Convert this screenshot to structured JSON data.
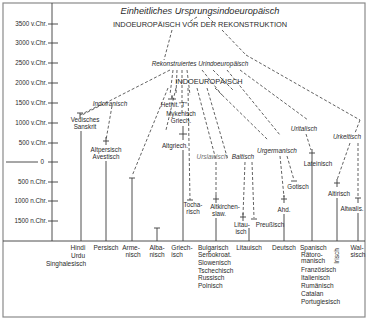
{
  "title": {
    "line1": "Einheitliches Ursprungsindoeuropäisch",
    "line2": "INDOEUROPÄISCH VOR DER REKONSTRUKTION"
  },
  "reconstructed": {
    "label": "Rekonstruiertes Urindoeuropäisch",
    "caps": "INDOEUROPÄISCH"
  },
  "axis": {
    "ticks": [
      "3500 v.Chr.",
      "3000 v.Chr.",
      "2500 v.Chr.",
      "2000 v.Chr.",
      "1500 v.Chr.",
      "1000 v.Chr.",
      "500 v.Chr.",
      "0",
      "500 n.Chr.",
      "1000 n.Chr.",
      "1500 n.Chr."
    ]
  },
  "branches": {
    "indoiranisch": "Indoiranisch",
    "urslawisch": "Urslawisch",
    "baltisch": "Baltisch",
    "urgermanisch": "Urgermanisch",
    "uritalisch": "Uritalisch",
    "urkeltisch": "Urkeltisch"
  },
  "ancient": {
    "hethit": "Hethit.\"T\"",
    "mykenisch_1": "Mykenisch",
    "mykenisch_2": "Griech.",
    "vedisch_1": "Vedisches",
    "vedisch_2": "Sanskrit",
    "altpersisch_1": "Altpersisch",
    "altpersisch_2": "Avestisch",
    "altgriech": "Altgriech.",
    "tochar_1": "Tocha-",
    "tochar_2": "risch",
    "altkirchen_1": "Altkirchen-",
    "altkirchen_2": "slaw.",
    "litau_1": "Litau-",
    "litau_2": "isch",
    "preussisch": "Preußisch",
    "lateinisch": "Lateinisch",
    "gotisch": "Gotisch",
    "ahd": "Ahd.",
    "altirisch": "Altirisch",
    "altwalis": "Altwalis."
  },
  "modern": {
    "indic": [
      "Hindi",
      "Urdu",
      "Singhalesisch"
    ],
    "persisch": [
      "Persisch"
    ],
    "armenisch": [
      "Arme-",
      "nisch"
    ],
    "albanisch": [
      "Alba-",
      "nisch"
    ],
    "griechisch": [
      "Griech-",
      "isch"
    ],
    "slavic": [
      "Bulgarisch",
      "Serbokroat.",
      "Slowenisch",
      "Tschechisch",
      "Russisch",
      "Polnisch"
    ],
    "litauisch": [
      "Litauisch"
    ],
    "deutsch": [
      "Deutsch"
    ],
    "romance": [
      "Spanisch",
      "Rätoro-",
      "manisch",
      "Französisch",
      "Italienisch",
      "Rumänisch",
      "Catalan",
      "Portugiesisch"
    ],
    "irisch": [
      "Irisch"
    ],
    "walisisch": [
      "Wal-",
      "sisch"
    ]
  }
}
